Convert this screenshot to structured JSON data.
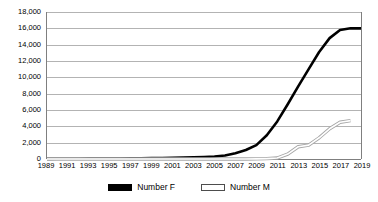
{
  "chart_data": {
    "type": "line",
    "title": "",
    "subtitle": "",
    "xlabel": "",
    "ylabel": "",
    "grid": true,
    "legend_position": "bottom",
    "x": [
      1989,
      1990,
      1991,
      1992,
      1993,
      1994,
      1995,
      1996,
      1997,
      1998,
      1999,
      2000,
      2001,
      2002,
      2003,
      2004,
      2005,
      2006,
      2007,
      2008,
      2009,
      2010,
      2011,
      2012,
      2013,
      2014,
      2015,
      2016,
      2017,
      2018,
      2019
    ],
    "x_tick_labels": [
      "1989",
      "1991",
      "1993",
      "1995",
      "1997",
      "1999",
      "2001",
      "2003",
      "2005",
      "2007",
      "2009",
      "2011",
      "2013",
      "2015",
      "2017",
      "2019"
    ],
    "y_tick_labels": [
      "0",
      "2,000",
      "4,000",
      "6,000",
      "8,000",
      "10,000",
      "12,000",
      "14,000",
      "16,000",
      "18,000"
    ],
    "y_tick_values": [
      0,
      2000,
      4000,
      6000,
      8000,
      10000,
      12000,
      14000,
      16000,
      18000
    ],
    "ylim": [
      0,
      18000
    ],
    "xlim": [
      1989,
      2019
    ],
    "series": [
      {
        "name": "Number F",
        "color": "#000000",
        "style": "solid-thick",
        "values": [
          20,
          25,
          30,
          35,
          40,
          50,
          60,
          70,
          80,
          95,
          110,
          130,
          150,
          180,
          210,
          250,
          300,
          420,
          700,
          1100,
          1700,
          2900,
          4600,
          6700,
          8900,
          11000,
          13100,
          14800,
          15800,
          16000,
          16000
        ]
      },
      {
        "name": "Number M",
        "color": "#a6a6a6",
        "style": "outline-thin",
        "values": [
          0,
          0,
          0,
          0,
          0,
          0,
          0,
          0,
          0,
          0,
          0,
          0,
          0,
          0,
          0,
          0,
          0,
          0,
          0,
          0,
          10,
          40,
          120,
          600,
          1500,
          1700,
          2600,
          3700,
          4500,
          4700,
          null
        ]
      }
    ]
  },
  "legend": {
    "entries": [
      {
        "label": "Number F",
        "swatch": "solid-black-swatch"
      },
      {
        "label": "Number M",
        "swatch": "outline-white-swatch"
      }
    ]
  }
}
